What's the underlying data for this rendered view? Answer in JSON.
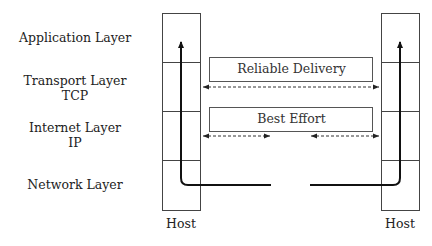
{
  "layers": [
    {
      "label": "Application Layer",
      "sub": ""
    },
    {
      "label": "Transport Layer",
      "sub": "TCP"
    },
    {
      "label": "Internet Layer",
      "sub": "IP"
    },
    {
      "label": "Network Layer",
      "sub": ""
    }
  ],
  "hosts": {
    "left": "Host",
    "right": "Host"
  },
  "channels": {
    "transport": "Reliable Delivery",
    "internet": "Best Effort"
  }
}
